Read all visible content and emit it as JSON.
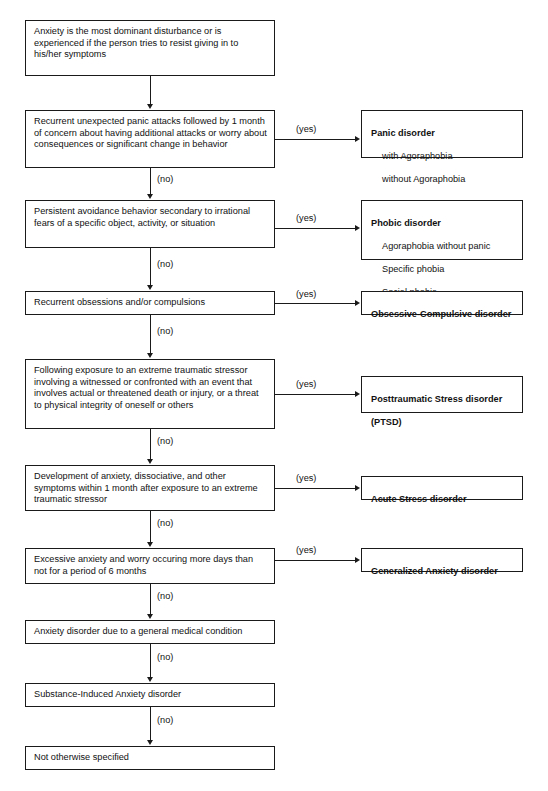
{
  "diagram": {
    "type": "decision-flowchart",
    "colors": {
      "line": "#1a1a1a",
      "text": "#111111",
      "background": "#ffffff"
    },
    "edge_labels": {
      "yes": "(yes)",
      "no": "(no)"
    },
    "decisions": [
      {
        "id": "d1",
        "text": "Anxiety is the most dominant disturbance or is experienced if the person tries to resist giving in to his/her symptoms",
        "no_label": "(no)"
      },
      {
        "id": "d2",
        "text": "Recurrent unexpected panic attacks followed by 1 month of concern about having additional attacks or worry about consequences or significant change in behavior",
        "yes_label": "(yes)",
        "no_label": "(no)"
      },
      {
        "id": "d3",
        "text": "Persistent avoidance behavior secondary to irrational fears of a specific object, activity, or situation",
        "yes_label": "(yes)",
        "no_label": "(no)"
      },
      {
        "id": "d4",
        "text": "Recurrent obsessions and/or compulsions",
        "yes_label": "(yes)",
        "no_label": "(no)"
      },
      {
        "id": "d5",
        "text": "Following exposure to an extreme traumatic stressor involving a witnessed or confronted with an event that involves actual or threatened death or injury, or a threat to physical integrity of oneself or others",
        "yes_label": "(yes)",
        "no_label": "(no)"
      },
      {
        "id": "d6",
        "text": "Development of anxiety, dissociative, and other symptoms within 1 month after exposure to an extreme traumatic stressor",
        "yes_label": "(yes)",
        "no_label": "(no)"
      },
      {
        "id": "d7",
        "text": "Excessive anxiety and worry occuring more days than not for a period of 6 months",
        "yes_label": "(yes)",
        "no_label": "(no)"
      },
      {
        "id": "d8",
        "text": "Anxiety disorder due to a general medical condition",
        "no_label": "(no)"
      },
      {
        "id": "d9",
        "text": "Substance-Induced Anxiety disorder",
        "no_label": "(no)"
      },
      {
        "id": "d10",
        "text": "Not otherwise specified"
      }
    ],
    "outcomes": [
      {
        "id": "o1",
        "title": "Panic disorder",
        "items": [
          "with Agoraphobia",
          "without Agoraphobia"
        ]
      },
      {
        "id": "o2",
        "title": "Phobic disorder",
        "items": [
          "Agoraphobia without panic",
          "Specific phobia",
          "Social phobia"
        ]
      },
      {
        "id": "o3",
        "title": "Obsessive-Compulsive disorder",
        "items": []
      },
      {
        "id": "o4",
        "title": "Posttraumatic Stress disorder",
        "items": [],
        "subtitle": "(PTSD)"
      },
      {
        "id": "o5",
        "title": "Acute Stress disorder",
        "items": []
      },
      {
        "id": "o6",
        "title": "Generalized Anxiety disorder",
        "items": []
      }
    ]
  }
}
